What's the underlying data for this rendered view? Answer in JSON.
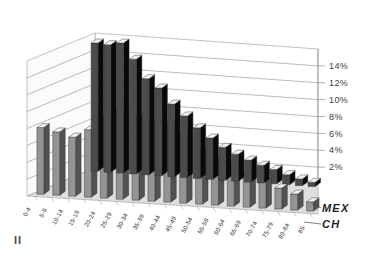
{
  "figure": {
    "marker": "II"
  },
  "chart_data": {
    "type": "bar",
    "title": "",
    "subtitle": "",
    "xlabel": "",
    "ylabel": "",
    "grid": true,
    "three_d": true,
    "legend_position": "right-inline",
    "ylim": [
      0,
      16
    ],
    "ytick_labels": [
      "2%",
      "4%",
      "6%",
      "8%",
      "10%",
      "12%",
      "14%"
    ],
    "ytick_values": [
      2,
      4,
      6,
      8,
      10,
      12,
      14
    ],
    "categories": [
      "0-4",
      "5-9",
      "10-14",
      "15-19",
      "20-24",
      "25-29",
      "30-34",
      "35-39",
      "40-44",
      "45-49",
      "50-54",
      "55-59",
      "60-64",
      "65-69",
      "70-74",
      "75-79",
      "80-84",
      "85-"
    ],
    "series": [
      {
        "name": "MEX",
        "color": "#4b4b4b",
        "values": [
          15.2,
          15.1,
          15.4,
          13.6,
          11.4,
          10.4,
          8.6,
          7.3,
          6.0,
          4.9,
          3.9,
          3.2,
          2.6,
          2.1,
          1.7,
          1.2,
          0.8,
          0.5
        ]
      },
      {
        "name": "CH",
        "color": "#949494",
        "values": [
          7.9,
          7.5,
          7.0,
          8.0,
          9.6,
          10.6,
          9.9,
          9.1,
          9.3,
          8.3,
          6.4,
          5.6,
          4.9,
          4.1,
          3.3,
          2.5,
          1.9,
          1.1
        ]
      }
    ]
  },
  "colors": {
    "series_mex": "#4b4b4b",
    "series_ch": "#949494",
    "bar_top": "#f2f2f2",
    "grid": "#8d8d8d",
    "floor": "#d8d8d8",
    "wall": "#ffffff",
    "text": "#2b2b2b"
  }
}
